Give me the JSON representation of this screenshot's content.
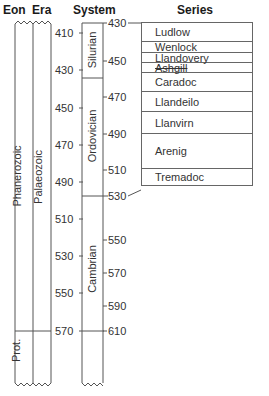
{
  "headers": {
    "eon": "Eon",
    "era": "Era",
    "system": "System",
    "series": "Series"
  },
  "eons": [
    {
      "name": "Phanerozoic"
    },
    {
      "name": "Prot."
    }
  ],
  "eras": [
    {
      "name": "Palaeozoic"
    }
  ],
  "systems": [
    {
      "name": "Silurian"
    },
    {
      "name": "Ordovician"
    },
    {
      "name": "Cambrian"
    }
  ],
  "left_scale": [
    "410",
    "430",
    "450",
    "470",
    "490",
    "510",
    "530",
    "550",
    "570"
  ],
  "right_scale": [
    "430",
    "450",
    "470",
    "490",
    "510",
    "530",
    "550",
    "570",
    "590",
    "610"
  ],
  "series": [
    {
      "name": "Ludlow"
    },
    {
      "name": "Wenlock"
    },
    {
      "name": "Llandovery"
    },
    {
      "name": "Ashgill"
    },
    {
      "name": "Caradoc"
    },
    {
      "name": "Llandeilo"
    },
    {
      "name": "Llanvirn"
    },
    {
      "name": "Arenig"
    },
    {
      "name": "Tremadoc"
    }
  ]
}
